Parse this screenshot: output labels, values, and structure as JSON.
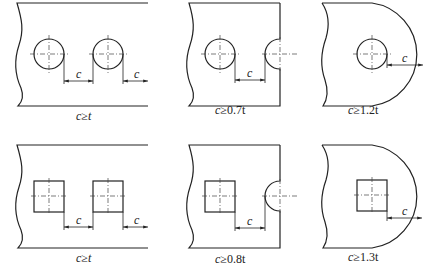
{
  "figure": {
    "dimension_symbol": "c",
    "thickness_symbol": "t",
    "relation": "≥",
    "panels": [
      {
        "id": "round-hole-to-hole",
        "row": 1,
        "hole_shape": "round",
        "edge": "straight-cut",
        "caption_var": "c",
        "caption_rel": "≥",
        "caption_value": "t",
        "caption": "c≥t"
      },
      {
        "id": "round-hole-to-notch",
        "row": 1,
        "hole_shape": "round",
        "edge": "semicircular notch",
        "caption_var": "c",
        "caption_rel": "≥",
        "caption_value": "0.7t",
        "caption": "c≥0.7t"
      },
      {
        "id": "round-hole-to-curved-edge",
        "row": 1,
        "hole_shape": "round",
        "edge": "curved outer edge",
        "caption_var": "c",
        "caption_rel": "≥",
        "caption_value": "1.2t",
        "caption": "c≥1.2t"
      },
      {
        "id": "square-hole-to-hole",
        "row": 2,
        "hole_shape": "square",
        "edge": "straight-cut",
        "caption_var": "c",
        "caption_rel": "≥",
        "caption_value": "t",
        "caption": "c≥t"
      },
      {
        "id": "square-hole-to-notch",
        "row": 2,
        "hole_shape": "square",
        "edge": "semicircular notch",
        "caption_var": "c",
        "caption_rel": "≥",
        "caption_value": "0.8t",
        "caption": "c≥0.8t"
      },
      {
        "id": "square-hole-to-curved-edge",
        "row": 2,
        "hole_shape": "square",
        "edge": "curved outer edge",
        "caption_var": "c",
        "caption_rel": "≥",
        "caption_value": "1.3t",
        "caption": "c≥1.3t"
      }
    ],
    "dimension_labels": [
      "c",
      "c",
      "c",
      "c",
      "c",
      "c",
      "c",
      "c"
    ]
  }
}
